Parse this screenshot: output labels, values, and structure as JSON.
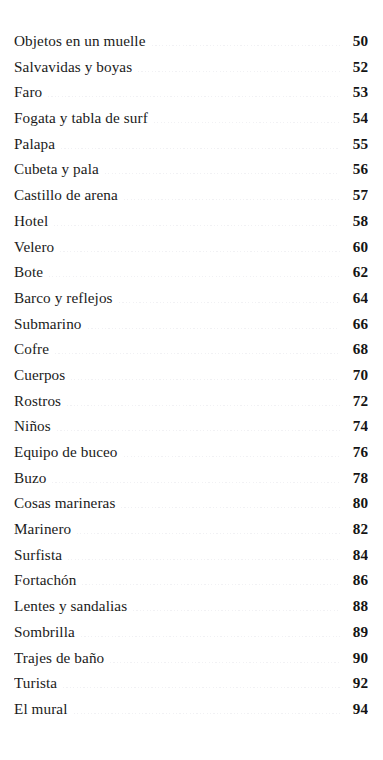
{
  "document": {
    "kind": "table-of-contents",
    "language": "es",
    "background_color": "#ffffff",
    "text_color": "#1a1a1a",
    "leader_color": "#f1f1f4"
  },
  "toc": {
    "entries": [
      {
        "title": "Objetos en un muelle",
        "page": "50"
      },
      {
        "title": "Salvavidas y boyas",
        "page": "52"
      },
      {
        "title": "Faro",
        "page": "53"
      },
      {
        "title": "Fogata y tabla de surf",
        "page": "54"
      },
      {
        "title": "Palapa",
        "page": "55"
      },
      {
        "title": "Cubeta y pala",
        "page": "56"
      },
      {
        "title": "Castillo de arena",
        "page": "57"
      },
      {
        "title": "Hotel",
        "page": "58"
      },
      {
        "title": "Velero",
        "page": "60"
      },
      {
        "title": "Bote",
        "page": "62"
      },
      {
        "title": "Barco y reflejos",
        "page": "64"
      },
      {
        "title": "Submarino",
        "page": "66"
      },
      {
        "title": "Cofre",
        "page": "68"
      },
      {
        "title": "Cuerpos",
        "page": "70"
      },
      {
        "title": "Rostros",
        "page": "72"
      },
      {
        "title": "Niños",
        "page": "74"
      },
      {
        "title": "Equipo de buceo",
        "page": "76"
      },
      {
        "title": "Buzo",
        "page": "78"
      },
      {
        "title": "Cosas marineras",
        "page": "80"
      },
      {
        "title": "Marinero",
        "page": "82"
      },
      {
        "title": "Surfista",
        "page": "84"
      },
      {
        "title": "Fortachón",
        "page": "86"
      },
      {
        "title": "Lentes y sandalias",
        "page": "88"
      },
      {
        "title": "Sombrilla",
        "page": "89"
      },
      {
        "title": "Trajes de baño",
        "page": "90"
      },
      {
        "title": "Turista",
        "page": "92"
      },
      {
        "title": "El mural",
        "page": "94"
      }
    ]
  }
}
